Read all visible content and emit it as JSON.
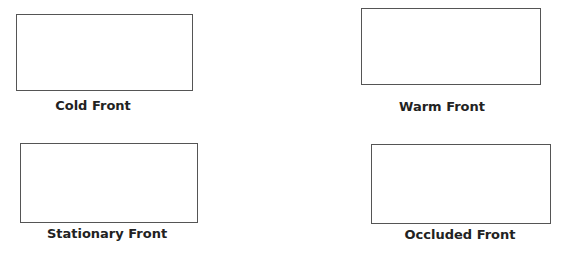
{
  "worksheet": {
    "fronts": [
      {
        "label": "Cold Front"
      },
      {
        "label": "Warm Front"
      },
      {
        "label": "Stationary Front"
      },
      {
        "label": "Occluded Front"
      }
    ]
  }
}
